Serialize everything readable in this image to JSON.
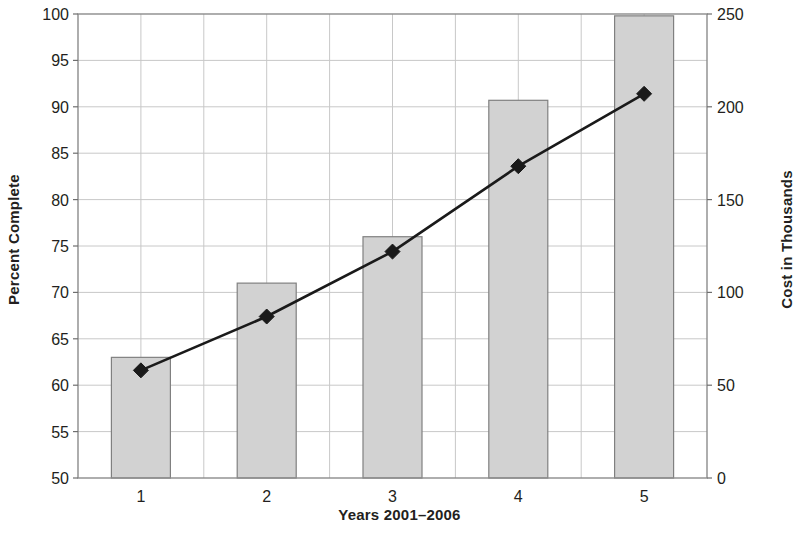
{
  "chart_data": {
    "type": "bar",
    "title": "",
    "xlabel": "Years 2001–2006",
    "categories": [
      "1",
      "2",
      "3",
      "4",
      "5"
    ],
    "grid": true,
    "legend": "none",
    "axes": {
      "left": {
        "label": "Percent Complete",
        "min": 50,
        "max": 100,
        "step": 5,
        "ticks": [
          "50",
          "55",
          "60",
          "65",
          "70",
          "75",
          "80",
          "85",
          "90",
          "95",
          "100"
        ]
      },
      "right": {
        "label": "Cost in Thousands",
        "min": 0,
        "max": 250,
        "step": 50,
        "ticks": [
          "0",
          "50",
          "100",
          "150",
          "200",
          "250"
        ]
      }
    },
    "series": [
      {
        "name": "Percent Complete",
        "type": "bar",
        "axis": "left",
        "color": "#d2d2d2",
        "border_color": "#808080",
        "values": [
          63,
          71,
          76,
          90.7,
          99.8
        ]
      },
      {
        "name": "Cost in Thousands",
        "type": "line",
        "axis": "right",
        "color": "#1a1a1a",
        "marker": "diamond",
        "values": [
          58,
          87,
          122,
          168,
          207
        ]
      }
    ]
  }
}
